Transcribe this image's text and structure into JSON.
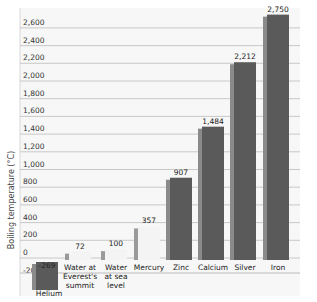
{
  "chart_data": {
    "type": "bar",
    "title": "",
    "xlabel": "",
    "ylabel": "Boiling temperature (°C)",
    "ylim": [
      -200,
      2700
    ],
    "yticks": [
      -200,
      0,
      200,
      400,
      600,
      800,
      1000,
      1200,
      1400,
      1600,
      1800,
      2000,
      2200,
      2400,
      2600
    ],
    "ytick_labels": [
      "-200",
      "0",
      "200",
      "400",
      "600",
      "800",
      "1,000",
      "1,200",
      "1,400",
      "1,600",
      "1,800",
      "2,000",
      "2,200",
      "2,400",
      "2,600"
    ],
    "grid": true,
    "legend": null,
    "categories": [
      "Helium",
      "Water at Everest's summit",
      "Water at sea level",
      "Mercury",
      "Zinc",
      "Calcium",
      "Silver",
      "Iron"
    ],
    "category_lines": [
      [
        "Helium"
      ],
      [
        "Water at",
        "Everest's",
        "summit"
      ],
      [
        "Water",
        "at sea",
        "level"
      ],
      [
        "Mercury"
      ],
      [
        "Zinc"
      ],
      [
        "Calcium"
      ],
      [
        "Silver"
      ],
      [
        "Iron"
      ]
    ],
    "values": [
      -269,
      72,
      100,
      357,
      907,
      1484,
      2212,
      2750
    ],
    "value_labels": [
      "-269",
      "72",
      "100",
      "357",
      "907",
      "1,484",
      "2,212",
      "2,750"
    ],
    "bar_styles": [
      "solid",
      "liquid",
      "liquid",
      "liquid",
      "solid",
      "solid",
      "solid",
      "solid"
    ]
  },
  "colors": {
    "solid_bar": "#5a5a5a",
    "solid_bar_side": "#8a8a8a",
    "liquid_bar": "#f4f4f4",
    "liquid_bar_side": "#9a9a9a",
    "grid": "#c8c8c8",
    "plot_bg": "#f7f7f7"
  }
}
